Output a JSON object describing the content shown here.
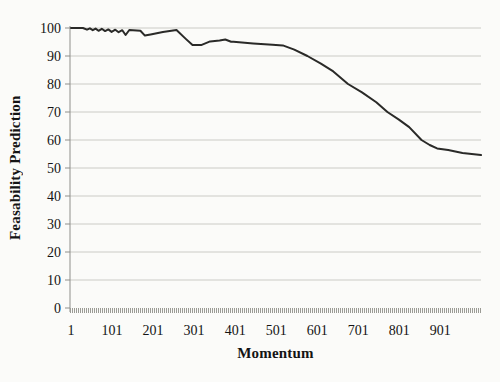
{
  "chart_data": {
    "type": "line",
    "title": "",
    "xlabel": "Momentum",
    "ylabel": "Feasability Prediction",
    "xlim": [
      1,
      1000
    ],
    "ylim": [
      0,
      100
    ],
    "x_ticks": [
      1,
      101,
      201,
      301,
      401,
      501,
      601,
      701,
      801,
      901
    ],
    "y_ticks": [
      0,
      10,
      20,
      30,
      40,
      50,
      60,
      70,
      80,
      90,
      100
    ],
    "grid": "horizontal",
    "legend": "none",
    "series": [
      {
        "name": "Feasability Prediction",
        "x": [
          1,
          30,
          40,
          47,
          54,
          61,
          68,
          76,
          84,
          92,
          100,
          109,
          117,
          126,
          134,
          143,
          152,
          170,
          181,
          195,
          225,
          258,
          280,
          297,
          318,
          340,
          363,
          377,
          391,
          397,
          445,
          492,
          517,
          545,
          577,
          610,
          640,
          676,
          710,
          745,
          772,
          800,
          825,
          855,
          875,
          893,
          920,
          955,
          1000
        ],
        "y": [
          100,
          100,
          99.4,
          99.9,
          99.2,
          99.8,
          99.0,
          99.7,
          98.9,
          99.5,
          98.6,
          99.4,
          98.5,
          99.2,
          97.5,
          99.3,
          99.2,
          99.0,
          97.3,
          97.7,
          98.6,
          99.3,
          96.2,
          93.9,
          93.9,
          95.2,
          95.5,
          95.9,
          95.1,
          95.1,
          94.5,
          94.0,
          93.8,
          92.3,
          90.0,
          87.3,
          84.5,
          80.0,
          77.0,
          73.5,
          70.0,
          67.3,
          64.6,
          60.0,
          58.2,
          57.0,
          56.4,
          55.4,
          54.6
        ]
      }
    ],
    "colors": {
      "line": "#2a2a28",
      "grid": "#cccc c8",
      "gridline": "#cbcbc6",
      "axis": "#8f8f8b",
      "tick_band": "#9b9b95",
      "text": "#141414",
      "background": "#fbfbf9"
    }
  }
}
